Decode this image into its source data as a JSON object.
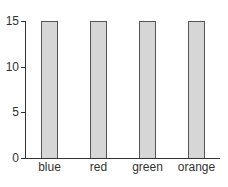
{
  "chart_data": {
    "type": "bar",
    "title": "",
    "xlabel": "",
    "ylabel": "",
    "categories": [
      "blue",
      "red",
      "green",
      "orange"
    ],
    "values": [
      15,
      15,
      15,
      15
    ],
    "ylim": [
      0,
      15
    ],
    "yticks": [
      0,
      5,
      10,
      15
    ],
    "grid": false,
    "legend": null,
    "colors": {
      "bar_fill": "#d6d6d6",
      "bar_edge": "#555555",
      "axis": "#333333"
    }
  },
  "axis": {
    "y_ticks": [
      {
        "label": "15",
        "value": 15
      },
      {
        "label": "10",
        "value": 10
      },
      {
        "label": "5",
        "value": 5
      },
      {
        "label": "0",
        "value": 0
      }
    ]
  }
}
